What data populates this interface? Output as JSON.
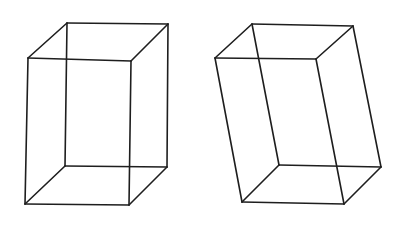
{
  "figure": {
    "background": "#ffffff",
    "stroke_color": "#1e1e1e",
    "cubes": [
      {
        "name": "upright-wireframe-box",
        "vertices": {
          "front_top_left": [
            28,
            58
          ],
          "front_top_right": [
            131,
            61
          ],
          "front_bottom_left": [
            25,
            204
          ],
          "front_bottom_right": [
            129,
            205
          ],
          "back_top_left": [
            67,
            23
          ],
          "back_top_right": [
            168,
            24
          ],
          "back_bottom_left": [
            65,
            166
          ],
          "back_bottom_right": [
            167,
            167
          ]
        }
      },
      {
        "name": "slanted-wireframe-box",
        "vertices": {
          "front_top_left": [
            215,
            58
          ],
          "front_top_right": [
            316,
            59
          ],
          "front_bottom_left": [
            242,
            202
          ],
          "front_bottom_right": [
            344,
            204
          ],
          "back_top_left": [
            252,
            24
          ],
          "back_top_right": [
            353,
            26
          ],
          "back_bottom_left": [
            279,
            165
          ],
          "back_bottom_right": [
            381,
            167
          ]
        }
      }
    ]
  }
}
